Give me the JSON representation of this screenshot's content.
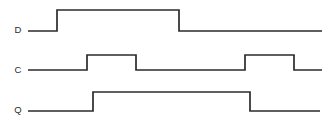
{
  "diagram": {
    "width": 336,
    "height": 121,
    "background_color": "#ffffff",
    "line_color": "#2b2b2b",
    "label_color": "#2b2b2b",
    "signals": [
      {
        "name": "D",
        "label": "D",
        "label_x": 18,
        "label_y": 30,
        "high_y": 10,
        "low_y": 31,
        "start_x": 28,
        "end_x": 322,
        "initial_level": "low",
        "transitions": [
          {
            "x": 57,
            "edge": "rising"
          },
          {
            "x": 179,
            "edge": "falling"
          }
        ],
        "path": "M 28 31 L 57 31 L 57 10 L 179 10 L 179 31 L 322 31"
      },
      {
        "name": "C",
        "label": "C",
        "label_x": 18,
        "label_y": 70,
        "high_y": 55,
        "low_y": 70,
        "start_x": 28,
        "end_x": 322,
        "initial_level": "low",
        "transitions": [
          {
            "x": 87,
            "edge": "rising"
          },
          {
            "x": 136,
            "edge": "falling"
          },
          {
            "x": 245,
            "edge": "rising"
          },
          {
            "x": 294,
            "edge": "falling"
          }
        ],
        "path": "M 28 70 L 87 70 L 87 55 L 136 55 L 136 70 L 245 70 L 245 55 L 294 55 L 294 70 L 322 70"
      },
      {
        "name": "Q",
        "label": "Q",
        "label_x": 18,
        "label_y": 110,
        "high_y": 92,
        "low_y": 111,
        "start_x": 28,
        "end_x": 320,
        "initial_level": "low",
        "transitions": [
          {
            "x": 93,
            "edge": "rising"
          },
          {
            "x": 250,
            "edge": "falling"
          }
        ],
        "path": "M 28 111 L 93 111 L 93 92 L 250 92 L 250 111 L 320 111"
      }
    ]
  }
}
